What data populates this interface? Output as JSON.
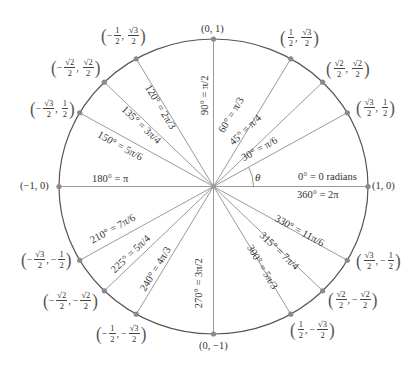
{
  "diagram": {
    "center": {
      "x": 213.5,
      "y": 186.5
    },
    "radius_x": 154.5,
    "radius_y": 147.5,
    "colors": {
      "circle": "#555555",
      "ray": "#9a9a9a",
      "point": "#8a8a8a",
      "text": "#333333"
    },
    "theta_label": "θ",
    "axis_right_label_top": "0° = 0 radians",
    "axis_right_label_bottom": "360° = 2π",
    "angles": [
      {
        "deg": 0,
        "label": "0° = 0 radians",
        "coord": "(1, 0)"
      },
      {
        "deg": 30,
        "label": "30° = π/6",
        "coord": "(√3/2, 1/2)"
      },
      {
        "deg": 45,
        "label": "45° = π/4",
        "coord": "(√2/2, √2/2)"
      },
      {
        "deg": 60,
        "label": "60° = π/3",
        "coord": "(1/2, √3/2)"
      },
      {
        "deg": 90,
        "label": "90° = π/2",
        "coord": "(0, 1)"
      },
      {
        "deg": 120,
        "label": "120° = 2π/3",
        "coord": "(−1/2, √3/2)"
      },
      {
        "deg": 135,
        "label": "135° = 3π/4",
        "coord": "(−√2/2, √2/2)"
      },
      {
        "deg": 150,
        "label": "150° = 5π/6",
        "coord": "(−√3/2, 1/2)"
      },
      {
        "deg": 180,
        "label": "180° = π",
        "coord": "(−1, 0)"
      },
      {
        "deg": 210,
        "label": "210° = 7π/6",
        "coord": "(−√3/2, −1/2)"
      },
      {
        "deg": 225,
        "label": "225° = 5π/4",
        "coord": "(−√2/2, −√2/2)"
      },
      {
        "deg": 240,
        "label": "240° = 4π/3",
        "coord": "(−1/2, −√3/2)"
      },
      {
        "deg": 270,
        "label": "270° = 3π/2",
        "coord": "(0, −1)"
      },
      {
        "deg": 300,
        "label": "300° = 5π/3",
        "coord": "(1/2, −√3/2)"
      },
      {
        "deg": 315,
        "label": "315° = 7π/4",
        "coord": "(√2/2, −√2/2)"
      },
      {
        "deg": 330,
        "label": "330° = 11π/6",
        "coord": "(√3/2, −1/2)"
      },
      {
        "deg": 360,
        "label": "360° = 2π",
        "coord": "(1, 0)"
      }
    ],
    "coord_labels": {
      "p0": {
        "text": "(1, 0)"
      },
      "p90": {
        "text": "(0, 1)"
      },
      "p180": {
        "text": "(−1, 0)"
      },
      "p270": {
        "text": "(0, −1)"
      },
      "p30": {
        "x_sign": "",
        "x_num": "√3",
        "x_den": "2",
        "y_sign": "",
        "y_num": "1",
        "y_den": "2"
      },
      "p45": {
        "x_sign": "",
        "x_num": "√2",
        "x_den": "2",
        "y_sign": "",
        "y_num": "√2",
        "y_den": "2"
      },
      "p60": {
        "x_sign": "",
        "x_num": "1",
        "x_den": "2",
        "y_sign": "",
        "y_num": "√3",
        "y_den": "2"
      },
      "p120": {
        "x_sign": "−",
        "x_num": "1",
        "x_den": "2",
        "y_sign": "",
        "y_num": "√3",
        "y_den": "2"
      },
      "p135": {
        "x_sign": "−",
        "x_num": "√2",
        "x_den": "2",
        "y_sign": "",
        "y_num": "√2",
        "y_den": "2"
      },
      "p150": {
        "x_sign": "−",
        "x_num": "√3",
        "x_den": "2",
        "y_sign": "",
        "y_num": "1",
        "y_den": "2"
      },
      "p210": {
        "x_sign": "−",
        "x_num": "√3",
        "x_den": "2",
        "y_sign": "−",
        "y_num": "1",
        "y_den": "2"
      },
      "p225": {
        "x_sign": "−",
        "x_num": "√2",
        "x_den": "2",
        "y_sign": "−",
        "y_num": "√2",
        "y_den": "2"
      },
      "p240": {
        "x_sign": "−",
        "x_num": "1",
        "x_den": "2",
        "y_sign": "−",
        "y_num": "√3",
        "y_den": "2"
      },
      "p300": {
        "x_sign": "",
        "x_num": "1",
        "x_den": "2",
        "y_sign": "−",
        "y_num": "√3",
        "y_den": "2"
      },
      "p315": {
        "x_sign": "",
        "x_num": "√2",
        "x_den": "2",
        "y_sign": "−",
        "y_num": "√2",
        "y_den": "2"
      },
      "p330": {
        "x_sign": "",
        "x_num": "√3",
        "x_den": "2",
        "y_sign": "−",
        "y_num": "1",
        "y_den": "2"
      }
    },
    "ray_labels": {
      "r30": "30° = π/6",
      "r45": "45° = π/4",
      "r60": "60° = π/3",
      "r90": "90° = π/2",
      "r120": "120° = 2π/3",
      "r135": "135° = 3π/4",
      "r150": "150° = 5π/6",
      "r180": "180° = π",
      "r210": "210° = 7π/6",
      "r225": "225° = 5π/4",
      "r240": "240° = 4π/3",
      "r270": "270° = 3π/2",
      "r300": "300° = 5π/3",
      "r315": "315° = 7π/4",
      "r330": "330° = 11π/6"
    }
  }
}
